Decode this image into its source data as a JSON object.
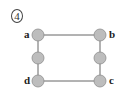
{
  "figure": {
    "number_label": "4",
    "number_style": "circled"
  },
  "colors": {
    "node_fill": "#bdbdbd",
    "node_stroke": "#8e8e8e",
    "edge": "#555555",
    "label": "#222222"
  },
  "nodes": [
    {
      "id": "a",
      "label": "a",
      "x": 38,
      "y": 35,
      "labeled": true
    },
    {
      "id": "left-mid",
      "label": "",
      "x": 38,
      "y": 58,
      "labeled": false
    },
    {
      "id": "d",
      "label": "d",
      "x": 38,
      "y": 81,
      "labeled": true
    },
    {
      "id": "b",
      "label": "b",
      "x": 100,
      "y": 35,
      "labeled": true
    },
    {
      "id": "right-mid",
      "label": "",
      "x": 100,
      "y": 58,
      "labeled": false
    },
    {
      "id": "c",
      "label": "c",
      "x": 100,
      "y": 81,
      "labeled": true
    }
  ],
  "edges": [
    {
      "from": "a",
      "to": "b"
    },
    {
      "from": "a",
      "to": "left-mid"
    },
    {
      "from": "left-mid",
      "to": "d"
    },
    {
      "from": "d",
      "to": "c"
    },
    {
      "from": "b",
      "to": "right-mid"
    },
    {
      "from": "right-mid",
      "to": "c"
    }
  ]
}
